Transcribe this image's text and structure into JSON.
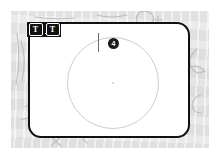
{
  "app": {
    "name": "Sketch Canvas"
  },
  "background": {
    "color": "#e9e9e9",
    "description": "faint pencil sketch texture"
  },
  "canvas": {
    "border_color": "#111111",
    "fill_color": "#ffffff"
  },
  "toolbar": {
    "background": "#111111",
    "items": [
      {
        "name": "text-tool",
        "glyph": "T",
        "label": "T",
        "selected": true
      },
      {
        "name": "text-tool-alt",
        "glyph": "T",
        "label": "T",
        "selected": false
      }
    ]
  },
  "shapes": {
    "circle": {
      "name": "circle-outline",
      "stroke": "#cdcdcd"
    },
    "center_dot": {
      "name": "circle-center-handle",
      "color": "#d2d2d2"
    }
  },
  "caret": {
    "name": "text-caret",
    "color": "#6f6f6f"
  },
  "badge": {
    "value": "4",
    "background": "#1b1b1b",
    "text_color": "#ffffff"
  }
}
